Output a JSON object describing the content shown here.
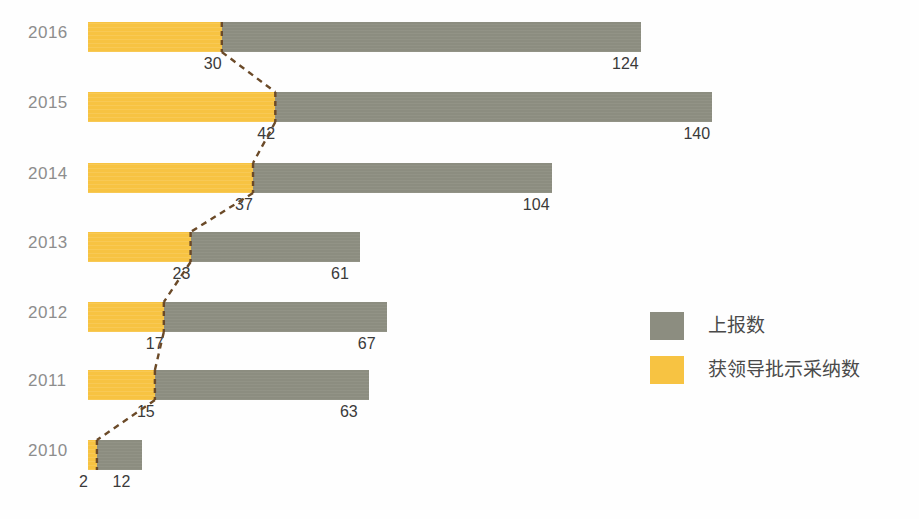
{
  "chart_data": {
    "type": "bar",
    "orientation": "horizontal",
    "stacked": true,
    "title": "",
    "subtitle": "",
    "xlabel": "",
    "ylabel": "",
    "grid": false,
    "xlim": [
      0,
      140
    ],
    "categories": [
      "2016",
      "2015",
      "2014",
      "2013",
      "2012",
      "2011",
      "2010"
    ],
    "series": [
      {
        "name": "获领导批示采纳数",
        "color": "#f7c342",
        "values": [
          30,
          42,
          37,
          23,
          17,
          15,
          2
        ]
      },
      {
        "name": "上报数",
        "color": "#8c8d80",
        "values": [
          124,
          140,
          104,
          61,
          67,
          63,
          12
        ],
        "note": "cumulative total length of the bar"
      }
    ],
    "annotations": {
      "connector_line": {
        "style": "dashed",
        "color": "#6b4a28",
        "description": "dashed line connecting the orange segment boundaries across years"
      }
    },
    "legend": {
      "position": "right-middle",
      "entries": [
        {
          "label": "上报数",
          "color": "#8c8d80",
          "swatch": "gray-swatch"
        },
        {
          "label": "获领导批示采纳数",
          "color": "#f7c342",
          "swatch": "orange-swatch"
        }
      ]
    }
  },
  "rows": [
    {
      "year": "2016",
      "accepted": "30",
      "reported": "124",
      "accepted_value": 30,
      "total_value": 124
    },
    {
      "year": "2015",
      "accepted": "42",
      "reported": "140",
      "accepted_value": 42,
      "total_value": 140
    },
    {
      "year": "2014",
      "accepted": "37",
      "reported": "104",
      "accepted_value": 37,
      "total_value": 104
    },
    {
      "year": "2013",
      "accepted": "23",
      "reported": "61",
      "accepted_value": 23,
      "total_value": 61
    },
    {
      "year": "2012",
      "accepted": "17",
      "reported": "67",
      "accepted_value": 17,
      "total_value": 67
    },
    {
      "year": "2011",
      "accepted": "15",
      "reported": "63",
      "accepted_value": 15,
      "total_value": 63
    },
    {
      "year": "2010",
      "accepted": "2",
      "reported": "12",
      "accepted_value": 2,
      "total_value": 12
    }
  ],
  "legend": {
    "items": [
      {
        "label": "上报数",
        "swatch_class": "gray"
      },
      {
        "label": "获领导批示采纳数",
        "swatch_class": "orange"
      }
    ]
  },
  "colors": {
    "orange": "#f7c342",
    "gray": "#8c8d80",
    "connector": "#6b4a28",
    "year_label": "#8d8d8d",
    "value_label": "#3a3a3a",
    "background": "#fefefe"
  },
  "layout": {
    "bar_start_x": 88,
    "px_per_unit": 4.46,
    "row_tops": [
      14,
      84,
      155,
      224,
      294,
      362,
      432
    ],
    "bar_height": 30
  }
}
